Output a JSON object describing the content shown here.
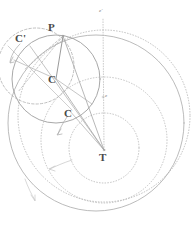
{
  "figure": {
    "background_color": "#ffffff",
    "ink_color": "#8c8c8c",
    "label_color": "#4a4a4a",
    "faint_color": "#bdbdbd",
    "width": 191,
    "height": 229
  },
  "labels": {
    "planet": "P",
    "epicycle_center": "C",
    "epicycle_center_prime": "C'",
    "epicycle_center_lower": "C",
    "earth": "T",
    "equant": "e",
    "equant_prime": "e'"
  },
  "diagram_data": {
    "type": "geometric-construction",
    "points": [
      {
        "name": "T",
        "label": "T",
        "x": 104,
        "y": 150,
        "role": "earth-center"
      },
      {
        "name": "P",
        "label": "P",
        "x": 63,
        "y": 35,
        "role": "planet"
      },
      {
        "name": "C",
        "label": "C",
        "x": 56,
        "y": 79,
        "role": "epicycle-center"
      },
      {
        "name": "Cp",
        "label": "C'",
        "x": 27,
        "y": 42,
        "role": "epicycle-center-prior"
      },
      {
        "name": "C2",
        "label": "C",
        "x": 71,
        "y": 114,
        "role": "epicycle-center-later"
      },
      {
        "name": "e",
        "label": "e",
        "x": 104,
        "y": 98,
        "role": "equant-point"
      },
      {
        "name": "ep",
        "label": "e'",
        "x": 102,
        "y": 12,
        "role": "equant-point-upper"
      }
    ],
    "circles": [
      {
        "name": "epicycle-solid",
        "cx": 56,
        "cy": 79,
        "r": 44,
        "style": "solid"
      },
      {
        "name": "epicycle-dashed",
        "cx": 36,
        "cy": 66,
        "r": 38,
        "style": "dashed"
      },
      {
        "name": "deferent-solid",
        "cx": 96,
        "cy": 123,
        "r": 88,
        "style": "solid"
      },
      {
        "name": "deferent-dotted",
        "cx": 104,
        "cy": 116,
        "r": 86,
        "style": "dotted"
      },
      {
        "name": "inner-dotted",
        "cx": 104,
        "cy": 140,
        "r": 63,
        "style": "dotted"
      },
      {
        "name": "core-dotted",
        "cx": 104,
        "cy": 148,
        "r": 35,
        "style": "dotted"
      }
    ],
    "lines": [
      {
        "name": "T-to-P",
        "from": "T",
        "to": "P",
        "style": "solid"
      },
      {
        "name": "T-to-C",
        "from": "T",
        "to": "C",
        "style": "solid"
      },
      {
        "name": "T-to-Cp",
        "from": "T",
        "to": "Cp",
        "style": "solid"
      },
      {
        "name": "C-to-P",
        "from": "C",
        "to": "P",
        "style": "solid"
      },
      {
        "name": "Cp-to-P",
        "from": "Cp",
        "to": "P",
        "style": "dashed"
      },
      {
        "name": "equant-axis",
        "from": "T",
        "to": "ep",
        "style": "dotted"
      }
    ],
    "arrows": [
      {
        "name": "motion-arrow-epicycle-prime",
        "near": "C'",
        "direction": "counterclockwise"
      },
      {
        "name": "motion-arrow-epicycle-lower",
        "near": "C",
        "direction": "downward"
      },
      {
        "name": "motion-arrow-deferent-inner",
        "near": "inner-dotted",
        "direction": "leftward"
      },
      {
        "name": "motion-arrow-deferent-outer",
        "near": "deferent-solid",
        "direction": "downward"
      }
    ]
  }
}
